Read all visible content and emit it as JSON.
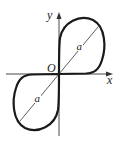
{
  "diagram": {
    "type": "curve-plot",
    "labels": {
      "y_axis": "y",
      "x_axis": "x",
      "origin": "O",
      "upper_loop_diameter": "a",
      "lower_loop_diameter": "a"
    },
    "colors": {
      "curve": "#1a1a1a",
      "axes": "#333333",
      "background": "#ffffff"
    }
  }
}
